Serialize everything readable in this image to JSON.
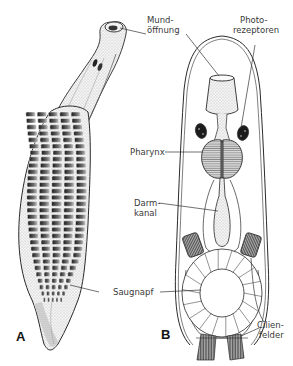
{
  "figure": {
    "panels": [
      {
        "id": "A",
        "label": "A",
        "subject": "leech-adult-ventral"
      },
      {
        "id": "B",
        "label": "B",
        "subject": "leech-larva-schematic"
      }
    ],
    "labels": {
      "mundoeffnung_1": "Mund-",
      "mundoeffnung_2": "öffnung",
      "photorezeptoren_1": "Photo-",
      "photorezeptoren_2": "rezeptoren",
      "pharynx": "Pharynx",
      "darmkanal_1": "Darm-",
      "darmkanal_2": "kanal",
      "saugnapf": "Saugnapf",
      "cilienfelder_1": "Cilien-",
      "cilienfelder_2": "felder"
    },
    "colors": {
      "ink": "#2a2a2a",
      "label_text": "#3a3a3a",
      "stipple": "#bdbdbd",
      "dark_organ": "#1c1c1c",
      "background": "#ffffff"
    }
  }
}
